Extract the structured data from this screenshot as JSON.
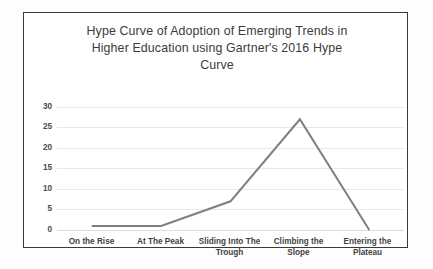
{
  "chart_data": {
    "type": "line",
    "title": "Hype Curve of Adoption of Emerging Trends in Higher Education using Gartner's 2016 Hype Curve",
    "title_lines": [
      "Hype Curve of Adoption of Emerging Trends in",
      "Higher Education using Gartner's 2016 Hype",
      "Curve"
    ],
    "categories": [
      "On the Rise",
      "At The Peak",
      "Sliding Into The Trough",
      "Climbing the Slope",
      "Entering the Plateau"
    ],
    "category_lines": [
      [
        "On the Rise"
      ],
      [
        "At The Peak"
      ],
      [
        "Sliding Into The",
        "Trough"
      ],
      [
        "Climbing the",
        "Slope"
      ],
      [
        "Entering the",
        "Plateau"
      ]
    ],
    "values": [
      1,
      1,
      7,
      27,
      0
    ],
    "xlabel": "",
    "ylabel": "",
    "ylim": [
      0,
      30
    ],
    "yticks": [
      0,
      5,
      10,
      15,
      20,
      25,
      30
    ],
    "grid": true,
    "legend": false,
    "series_color": "#7f7f7f",
    "gridline_color": "#e9e9e9",
    "border_color": "#3a3a3a",
    "background": "#ffffff"
  }
}
